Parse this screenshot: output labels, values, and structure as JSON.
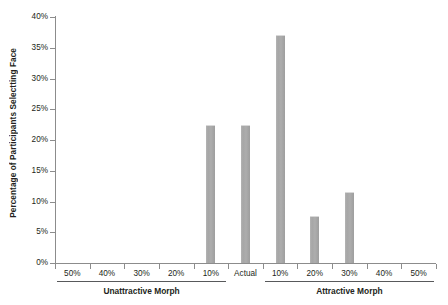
{
  "chart_data": {
    "type": "bar",
    "title": "",
    "xlabel": "",
    "ylabel": "Percentage of Participants Selectting Face",
    "categories": [
      "50%",
      "40%",
      "30%",
      "20%",
      "10%",
      "Actual",
      "10%",
      "20%",
      "30%",
      "40%",
      "50%"
    ],
    "values": [
      0,
      0,
      0,
      0,
      22.4,
      22.4,
      37.0,
      7.6,
      11.5,
      0,
      0
    ],
    "ylim": [
      0,
      40
    ],
    "yticks": [
      0,
      5,
      10,
      15,
      20,
      25,
      30,
      35,
      40
    ],
    "ytick_labels": [
      "0%",
      "5%",
      "10%",
      "15%",
      "20%",
      "25%",
      "30%",
      "35%",
      "40%"
    ],
    "grid": false,
    "legend": null,
    "bar_color": "#a8a8a8",
    "axis_color": "#8c8c8c",
    "text_color": "#231f20",
    "groups": [
      {
        "label": "Unattractive Morph",
        "categories": [
          "50%",
          "40%",
          "30%",
          "20%",
          "10%"
        ]
      },
      {
        "label": "Attractive Morph",
        "categories": [
          "10%",
          "20%",
          "30%",
          "40%",
          "50%"
        ]
      }
    ]
  }
}
